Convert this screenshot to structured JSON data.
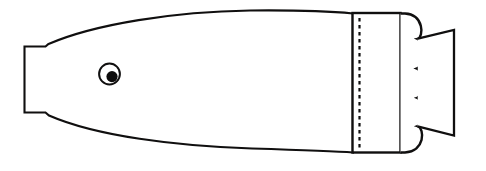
{
  "figure": {
    "canvas": {
      "width": 486,
      "height": 171,
      "background_color": "#ffffff"
    },
    "line_color": "#100f0f",
    "fill_color": "#ffffff",
    "pupil_color": "#0d0c0c",
    "parts": [
      {
        "name": "body-hull",
        "label": "Tapered hull with flat nozzle end",
        "stroke_width": 2.1,
        "path": "M 24.5 46.5 L 45.5 46.5 L 48.5 44.0 C 95 24.0 175 11.5 250 10.5 C 300 10.0 335 11.8 353.0 13.5 L 353.0 152.5 C 335 151.2 300 150.0 252 148.5 C 176 146.2 96 136.0 49.0 115.5 L 45.5 112.5 L 24.5 112.5 Z"
      },
      {
        "name": "eye-outer-ring",
        "label": "Eye outline circle",
        "stroke_width": 2.0,
        "cx": 109.5,
        "cy": 74.0,
        "r": 10.4
      },
      {
        "name": "eye-pupil",
        "label": "Filled pupil dot",
        "cx": 112.0,
        "cy": 76.6,
        "r": 5.6
      },
      {
        "name": "band-rectangle",
        "label": "Vertical rectangular band",
        "stroke_width": 2.4,
        "x": 352.5,
        "y": 13.0,
        "width": 48.0,
        "height": 139.5
      },
      {
        "name": "seam-dashed-line",
        "label": "Dashed seam line inside band",
        "stroke_width": 2.2,
        "dash_pattern": "3.5 3.5",
        "x": 359.5,
        "y_top": 18.0,
        "y_bottom": 148.0
      },
      {
        "name": "scalloped-tail",
        "label": "Four-lobe scalloped tail edge",
        "stroke_width": 2.4,
        "path": "M 400.5 13.5 L 405.0 13.5 C 424.0 14.5 424.0 37.0 417.5 38.8 C 424.5 41.5 424.5 66.0 417.0 68.5 C 424.5 71.2 424.5 95.0 417.2 97.8 C 424.5 100.5 424.5 123.5 417.5 126.2 C 425.0 128.5 425.0 151.5 405.0 152.5 L 400.5 152.5"
      },
      {
        "name": "end-cap-trapezoid",
        "label": "Trapezoidal end cap",
        "stroke_width": 2.3,
        "path": "M 417.8 38.6 L 454.0 30.0 L 454.0 135.5 L 417.6 126.4"
      }
    ]
  }
}
